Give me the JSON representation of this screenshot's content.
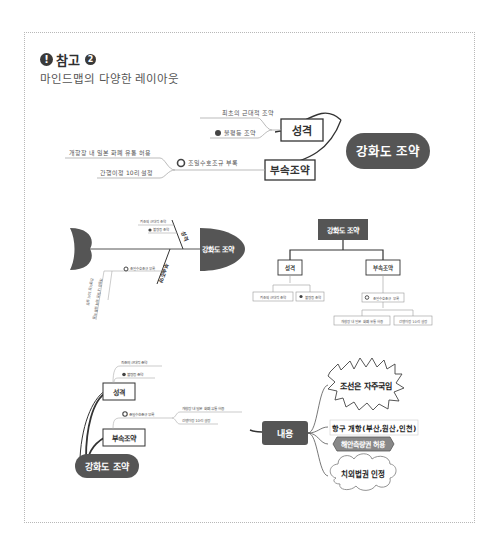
{
  "header": {
    "icon": "exclamation-circle-icon",
    "title": "참고",
    "badge_number": "2",
    "subtitle": "마인드맵의 다양한 레이아웃"
  },
  "layout1": {
    "name": "logic-chart-left",
    "root": "강화도 조약",
    "branches": [
      {
        "label": "성격",
        "children": [
          "최초의 근대적 조약",
          "불평등 조약"
        ]
      },
      {
        "label": "부속조약",
        "children": [
          "조일수호조규 부록"
        ],
        "grandchildren": [
          "개항장 내 일본 화폐 유통 허용",
          "간행이정 10리 설정"
        ]
      }
    ]
  },
  "layout2": {
    "name": "fishbone",
    "root": "강화도 조약",
    "branches": [
      {
        "label": "성격",
        "children": [
          "최초의 근대적 조약",
          "불평등 조약"
        ]
      },
      {
        "label": "부속조약",
        "children": [
          "조일수호조규 부록"
        ],
        "grandchildren": [
          "개항장 내 일본 화폐 유통 허용",
          "간행이정 10리 설정"
        ]
      }
    ]
  },
  "layout3": {
    "name": "org-chart",
    "root": "강화도 조약",
    "branches": [
      {
        "label": "성격",
        "children": [
          "최초의 근대적 조약",
          "불평등 조약"
        ]
      },
      {
        "label": "부속조약",
        "children": [
          "조일수호조규 부록"
        ],
        "grandchildren": [
          "개항장 내 일본 화폐 유통 허용",
          "간행이정 10리 설정"
        ]
      }
    ]
  },
  "layout4": {
    "name": "free-map",
    "root": "강화도 조약",
    "branches": [
      {
        "label": "성격",
        "children": [
          "최초의 근대적 조약",
          "불평등 조약"
        ]
      },
      {
        "label": "부속조약",
        "children": [
          "조일수호조규 부록"
        ],
        "grandchildren": [
          "개항장 내 일본 화폐 유통 허용",
          "간행이정 10리 설정"
        ]
      }
    ],
    "content_node": "내용",
    "content_items": [
      "조선은 자주국임",
      "항구 개항(부산,원산,인천)",
      "해안측량권 허용",
      "치외법권 인정"
    ]
  },
  "colors": {
    "node_dark": "#555555",
    "line": "#333333",
    "border_light": "#aaaaaa"
  }
}
